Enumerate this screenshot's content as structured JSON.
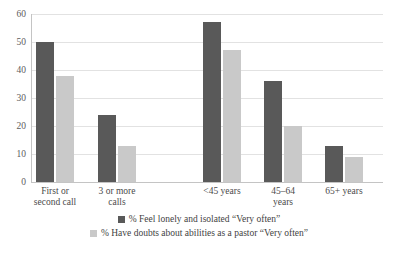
{
  "chart_data": {
    "type": "bar",
    "title": "",
    "xlabel": "",
    "ylabel": "",
    "ylim": [
      0,
      60
    ],
    "yticks": [
      0,
      10,
      20,
      30,
      40,
      50,
      60
    ],
    "grid": true,
    "legend_position": "bottom",
    "categories": [
      "First or second call",
      "3 or more calls",
      "<45 years",
      "45–64 years",
      "65+ years"
    ],
    "category_lines": [
      [
        "First or",
        "second call"
      ],
      [
        "3 or more",
        "calls"
      ],
      [
        "<45 years",
        ""
      ],
      [
        "45–64",
        "years"
      ],
      [
        "65+ years",
        ""
      ]
    ],
    "series": [
      {
        "name": "% Feel lonely and isolated “Very often”",
        "color": "#595959",
        "values": [
          50,
          24,
          57,
          36,
          13
        ]
      },
      {
        "name": "% Have doubts about abilities as a pastor “Very often”",
        "color": "#c9c9c9",
        "values": [
          38,
          13,
          47,
          20,
          9
        ]
      }
    ]
  },
  "colors": {
    "series_dark": "#595959",
    "series_light": "#c9c9c9",
    "gridline": "#e2e2e2",
    "axis": "#c4c4c4",
    "text": "#4a4a4a",
    "background": "#ffffff"
  },
  "legend": {
    "items": [
      {
        "label": "% Feel lonely and isolated “Very often”",
        "color": "#595959"
      },
      {
        "label": "% Have doubts about abilities as a pastor “Very often”",
        "color": "#c9c9c9"
      }
    ]
  },
  "axis": {
    "y_tick_labels": [
      "60",
      "50",
      "40",
      "30",
      "20",
      "10",
      "0"
    ]
  }
}
